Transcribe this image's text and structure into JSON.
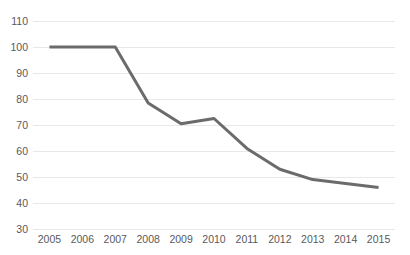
{
  "chart_data": {
    "type": "line",
    "title": "",
    "subtitle": "",
    "xlabel": "",
    "ylabel": "",
    "categories": [
      "2005",
      "2006",
      "2007",
      "2008",
      "2009",
      "2010",
      "2011",
      "2012",
      "2013",
      "2014",
      "2015"
    ],
    "x": [
      2005,
      2006,
      2007,
      2008,
      2009,
      2010,
      2011,
      2012,
      2013,
      2014,
      2015
    ],
    "series": [
      {
        "name": "",
        "values": [
          100,
          100,
          100,
          78.5,
          70.5,
          72.5,
          61,
          53,
          49,
          47.5,
          46
        ]
      }
    ],
    "ylim": [
      30,
      110
    ],
    "yticks": [
      30,
      40,
      50,
      60,
      70,
      80,
      90,
      100,
      110
    ],
    "ytick_labels": [
      "30",
      "40",
      "50",
      "60",
      "70",
      "80",
      "90",
      "100",
      "110"
    ],
    "xtick_labels": [
      "2005",
      "2006",
      "2007",
      "2008",
      "2009",
      "2010",
      "2011",
      "2012",
      "2013",
      "2014",
      "2015"
    ],
    "grid": true,
    "grid_axis": "y",
    "legend": false,
    "legend_position": "none",
    "annotations": [],
    "colors": {
      "line": "#6b6b6b",
      "gridline": "#e8e8e8",
      "background": "#ffffff",
      "tick_label": "#59595b"
    },
    "line_width": 3
  }
}
